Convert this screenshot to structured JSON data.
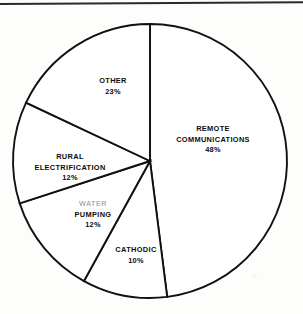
{
  "chart_data": {
    "type": "pie",
    "title": "",
    "subtitle": "",
    "xlabel": "",
    "ylabel": "",
    "legend_position": "none",
    "grid": false,
    "units": "percent",
    "note": "Slice percentages as printed total 105%.",
    "categories": [
      "REMOTE COMMUNICATIONS",
      "CATHODIC",
      "WATER PUMPING",
      "RURAL ELECTRIFICATION",
      "OTHER"
    ],
    "values": [
      48,
      10,
      12,
      12,
      23
    ],
    "slices": [
      {
        "label": "REMOTE COMMUNICATIONS",
        "label_line1": "REMOTE",
        "label_line2": "COMMUNICATIONS",
        "value": 48,
        "value_label": "48%",
        "start_angle_deg": 0,
        "end_angle_deg": 172.8,
        "fill": "#ffffff",
        "stroke": "#111111"
      },
      {
        "label": "CATHODIC",
        "label_line1": "CATHODIC",
        "label_line2": "",
        "value": 10,
        "value_label": "10%",
        "start_angle_deg": 172.8,
        "end_angle_deg": 208.8,
        "fill": "#ffffff",
        "stroke": "#111111"
      },
      {
        "label": "WATER PUMPING",
        "label_line1": "WATER",
        "label_line2": "PUMPING",
        "value": 12,
        "value_label": "12%",
        "start_angle_deg": 208.8,
        "end_angle_deg": 252.0,
        "fill": "#ffffff",
        "stroke": "#111111"
      },
      {
        "label": "RURAL ELECTRIFICATION",
        "label_line1": "RURAL",
        "label_line2": "ELECTRIFICATION",
        "value": 12,
        "value_label": "12%",
        "start_angle_deg": 252.0,
        "end_angle_deg": 295.2,
        "fill": "#ffffff",
        "stroke": "#111111"
      },
      {
        "label": "OTHER",
        "label_line1": "OTHER",
        "label_line2": "",
        "value": 23,
        "value_label": "23%",
        "start_angle_deg": 295.2,
        "end_angle_deg": 360,
        "fill": "#ffffff",
        "stroke": "#111111"
      }
    ]
  },
  "geometry": {
    "center_x": 150,
    "center_y": 161,
    "radius": 137
  },
  "colors": {
    "ink": "#111111",
    "paper": "#fdfdfc",
    "rule": "#2a2a2a"
  }
}
